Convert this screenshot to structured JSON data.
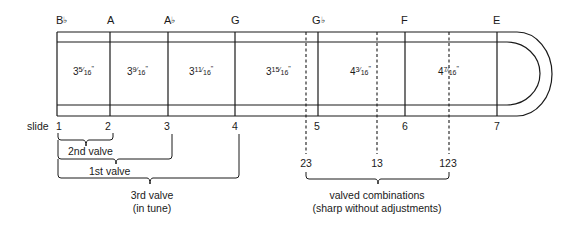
{
  "notes": [
    {
      "letter": "B",
      "flat": "♭",
      "x": 56
    },
    {
      "letter": "A",
      "flat": "",
      "x": 107
    },
    {
      "letter": "A",
      "flat": "♭",
      "x": 164
    },
    {
      "letter": "G",
      "flat": "",
      "x": 231
    },
    {
      "letter": "G",
      "flat": "♭",
      "x": 312
    },
    {
      "letter": "F",
      "flat": "",
      "x": 401
    },
    {
      "letter": "E",
      "flat": "",
      "x": 493
    }
  ],
  "segments": [
    {
      "whole": "3",
      "num": "5",
      "den": "16",
      "unit": "\"",
      "x": 72
    },
    {
      "whole": "3",
      "num": "9",
      "den": "16",
      "unit": "\"",
      "x": 128
    },
    {
      "whole": "3",
      "num": "11",
      "den": "16",
      "unit": "\"",
      "x": 190
    },
    {
      "whole": "3",
      "num": "15",
      "den": "16",
      "unit": "\"",
      "x": 266
    },
    {
      "whole": "4",
      "num": "3",
      "den": "16",
      "unit": "\"",
      "x": 349
    },
    {
      "whole": "4",
      "num": "7",
      "den": "16",
      "unit": "\"",
      "x": 438
    }
  ],
  "slide": {
    "label": "slide",
    "positions": [
      {
        "label": "1",
        "x": 58
      },
      {
        "label": "2",
        "x": 108
      },
      {
        "label": "3",
        "x": 167
      },
      {
        "label": "4",
        "x": 234
      },
      {
        "label": "5",
        "x": 321
      },
      {
        "label": "6",
        "x": 405
      },
      {
        "label": "7",
        "x": 497
      }
    ]
  },
  "valve_braces": {
    "second": {
      "label": "2nd valve"
    },
    "first": {
      "label": "1st valve"
    },
    "third": {
      "label": "3rd valve",
      "sublabel": "(in tune)"
    }
  },
  "combinations": {
    "labels": [
      {
        "label": "23",
        "x": 306
      },
      {
        "label": "13",
        "x": 377
      },
      {
        "label": "123",
        "x": 449
      }
    ],
    "caption": "valved combinations",
    "subcaption": "(sharp without adjustments)"
  }
}
